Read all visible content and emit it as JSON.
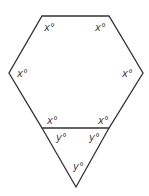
{
  "diagram": {
    "type": "geometry",
    "stroke_color": "#333333",
    "label_color": "#444444",
    "vertices": {
      "top_left": [
        42,
        16
      ],
      "top_right": [
        109,
        16
      ],
      "right": [
        143,
        73
      ],
      "bottom_right": [
        109,
        128
      ],
      "bottom_left": [
        42,
        128
      ],
      "left": [
        9,
        73
      ],
      "apex": [
        76,
        187
      ]
    },
    "labels": [
      {
        "id": "hex-top-left",
        "text": "x°",
        "x": 44,
        "y": 31
      },
      {
        "id": "hex-top-right",
        "text": "x°",
        "x": 95,
        "y": 31
      },
      {
        "id": "hex-left",
        "text": "x°",
        "x": 17,
        "y": 77
      },
      {
        "id": "hex-right",
        "text": "x°",
        "x": 122,
        "y": 77
      },
      {
        "id": "hex-bottom-left",
        "text": "x°",
        "x": 47,
        "y": 124
      },
      {
        "id": "hex-bottom-right",
        "text": "x°",
        "x": 98,
        "y": 124
      },
      {
        "id": "tri-left",
        "text": "y°",
        "x": 56,
        "y": 141
      },
      {
        "id": "tri-right",
        "text": "y°",
        "x": 89,
        "y": 141
      },
      {
        "id": "tri-apex",
        "text": "y°",
        "x": 73,
        "y": 170
      }
    ]
  }
}
